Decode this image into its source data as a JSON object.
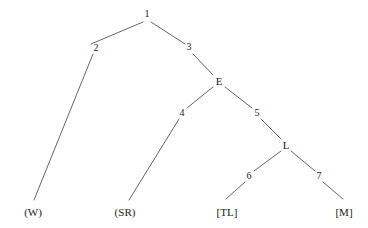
{
  "figure": {
    "type": "tree-diagram",
    "title": "",
    "background_color": "#ffffff",
    "line_color": "#555555",
    "text_color": "#1a1a1a"
  },
  "nodes": {
    "root": {
      "label": "1",
      "x": 147,
      "y": 14,
      "kind": "edge-number"
    },
    "n2": {
      "label": "2",
      "x": 96,
      "y": 48,
      "kind": "edge-number"
    },
    "n3": {
      "label": "3",
      "x": 189,
      "y": 47,
      "kind": "edge-number"
    },
    "nE": {
      "label": "E",
      "x": 219,
      "y": 81,
      "kind": "internal"
    },
    "n4": {
      "label": "4",
      "x": 182,
      "y": 113,
      "kind": "edge-number"
    },
    "n5": {
      "label": "5",
      "x": 257,
      "y": 113,
      "kind": "edge-number"
    },
    "nL": {
      "label": "L",
      "x": 286,
      "y": 145,
      "kind": "internal"
    },
    "n6": {
      "label": "6",
      "x": 249,
      "y": 176,
      "kind": "edge-number"
    },
    "n7": {
      "label": "7",
      "x": 319,
      "y": 176,
      "kind": "edge-number"
    }
  },
  "leaves": [
    {
      "label": "(W)",
      "x": 33,
      "y": 212
    },
    {
      "label": "(SR)",
      "x": 125,
      "y": 212
    },
    {
      "label": "[TL]",
      "x": 227,
      "y": 212
    },
    {
      "label": "[M]",
      "x": 344,
      "y": 212
    }
  ],
  "edges": [
    {
      "id": "root-to-2",
      "from": "1",
      "to": "2",
      "x1": 143,
      "y1": 22,
      "x2": 91,
      "y2": 44
    },
    {
      "id": "root-to-3",
      "from": "1",
      "to": "3",
      "x1": 151,
      "y1": 22,
      "x2": 185,
      "y2": 44
    },
    {
      "id": "2-to-W",
      "from": "2",
      "to": "(W)",
      "x1": 93,
      "y1": 54,
      "x2": 34,
      "y2": 200
    },
    {
      "id": "3-to-E",
      "from": "3",
      "to": "E",
      "x1": 193,
      "y1": 54,
      "x2": 213,
      "y2": 75
    },
    {
      "id": "E-to-4",
      "from": "E",
      "to": "4",
      "x1": 213,
      "y1": 87,
      "x2": 187,
      "y2": 108
    },
    {
      "id": "E-to-5",
      "from": "E",
      "to": "5",
      "x1": 225,
      "y1": 87,
      "x2": 252,
      "y2": 108
    },
    {
      "id": "4-to-SR",
      "from": "4",
      "to": "(SR)",
      "x1": 179,
      "y1": 119,
      "x2": 129,
      "y2": 200
    },
    {
      "id": "5-to-L",
      "from": "5",
      "to": "L",
      "x1": 261,
      "y1": 119,
      "x2": 281,
      "y2": 139
    },
    {
      "id": "L-to-6",
      "from": "L",
      "to": "6",
      "x1": 281,
      "y1": 151,
      "x2": 254,
      "y2": 171
    },
    {
      "id": "L-to-7",
      "from": "L",
      "to": "7",
      "x1": 291,
      "y1": 151,
      "x2": 315,
      "y2": 171
    },
    {
      "id": "6-to-TL",
      "from": "6",
      "to": "[TL]",
      "x1": 245,
      "y1": 182,
      "x2": 226,
      "y2": 199
    },
    {
      "id": "7-to-M",
      "from": "7",
      "to": "[M]",
      "x1": 323,
      "y1": 182,
      "x2": 343,
      "y2": 199
    }
  ]
}
